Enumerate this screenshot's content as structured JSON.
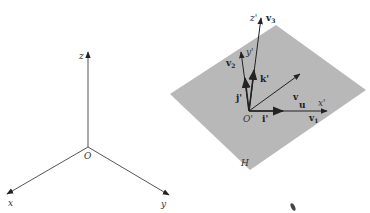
{
  "figure": {
    "left_diagram": {
      "name": "standard-coordinate-axes",
      "origin_label": "O",
      "axes": [
        {
          "label": "z"
        },
        {
          "label": "x"
        },
        {
          "label": "y"
        }
      ]
    },
    "right_diagram": {
      "name": "plane-with-local-frame",
      "plane_label": "H",
      "origin_label": "O'",
      "axes": [
        {
          "label": "x'"
        },
        {
          "label": "y'"
        },
        {
          "label": "z'"
        }
      ],
      "unit_vectors": [
        {
          "label": "i'"
        },
        {
          "label": "j'"
        },
        {
          "label": "k'"
        }
      ],
      "vectors": [
        {
          "label": "u"
        },
        {
          "label": "v"
        },
        {
          "label": "v",
          "sub": "1"
        },
        {
          "label": "v",
          "sub": "2"
        },
        {
          "label": "v",
          "sub": "3"
        }
      ],
      "plane_color": "#b8b8b8",
      "line_color": "#222222"
    }
  }
}
